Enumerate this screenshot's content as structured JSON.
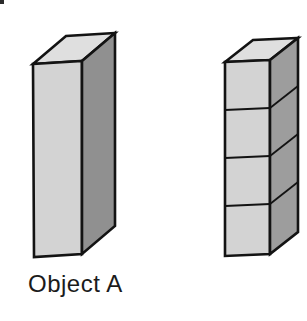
{
  "figure": {
    "label": "Object A",
    "colors": {
      "background": "#ffffff",
      "outline": "#131313",
      "label_text": "#1b1b1b",
      "corner_mark": "#2b2b2b"
    },
    "strokes": {
      "outer_width": 2.6,
      "division_width": 1.8
    },
    "prisms": [
      {
        "id": "object-a-prism",
        "description": "solid rectangular prism",
        "segments": 1,
        "colors": {
          "top": "#dfdfdf",
          "front": "#d3d3d3",
          "side": "#909090"
        },
        "geometry": {
          "top": [
            [
              33,
              64
            ],
            [
              66,
              36
            ],
            [
              115,
              33
            ],
            [
              82,
              61
            ]
          ],
          "front": [
            [
              33,
              64
            ],
            [
              82,
              61
            ],
            [
              82,
              254
            ],
            [
              34,
              257
            ]
          ],
          "side": [
            [
              82,
              61
            ],
            [
              115,
              33
            ],
            [
              115,
              226
            ],
            [
              82,
              254
            ]
          ],
          "front_divisions": [],
          "side_divisions": []
        }
      },
      {
        "id": "segmented-prism",
        "description": "rectangular prism divided into 4 stacked cubes",
        "segments": 4,
        "colors": {
          "top": "#dfdfdf",
          "front": "#d3d3d3",
          "side": "#9d9d9d"
        },
        "geometry": {
          "top": [
            [
              225,
              62
            ],
            [
              253,
              40
            ],
            [
              298,
              38
            ],
            [
              270,
              60
            ]
          ],
          "front": [
            [
              225,
              62
            ],
            [
              270,
              60
            ],
            [
              270,
              254
            ],
            [
              225,
              256
            ]
          ],
          "side": [
            [
              270,
              60
            ],
            [
              298,
              38
            ],
            [
              298,
              232
            ],
            [
              270,
              254
            ]
          ],
          "front_divisions": [
            [
              [
                225,
                110
              ],
              [
                270,
                108
              ]
            ],
            [
              [
                225,
                158
              ],
              [
                270,
                156
              ]
            ],
            [
              [
                225,
                206
              ],
              [
                270,
                204
              ]
            ]
          ],
          "side_divisions": [
            [
              [
                270,
                108
              ],
              [
                298,
                86
              ]
            ],
            [
              [
                270,
                156
              ],
              [
                298,
                134
              ]
            ],
            [
              [
                270,
                204
              ],
              [
                298,
                182
              ]
            ]
          ]
        }
      }
    ]
  }
}
